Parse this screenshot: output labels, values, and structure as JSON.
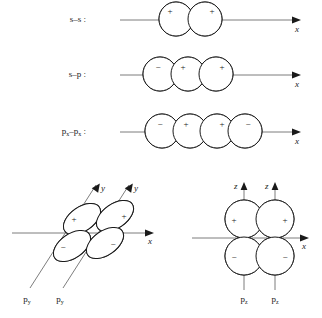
{
  "figure": {
    "background_color": "#ffffff",
    "line_color": "#1a1a1a",
    "axis_color": "#6e6e6e",
    "overlap_fill": "#c9c9c9",
    "lobe_fill": "#ffffff"
  },
  "rows": [
    {
      "id": "s-s",
      "label": "s–s :",
      "axis_label": "x",
      "orbital_count": 2,
      "signs": [
        "+",
        "+"
      ],
      "overlap_regions": 1,
      "shape": "circle"
    },
    {
      "id": "s-p",
      "label": "s–p :",
      "axis_label": "x",
      "orbital_count": 3,
      "signs": [
        "−",
        "+",
        "+"
      ],
      "overlap_regions": 1,
      "shape": "circle"
    },
    {
      "id": "px-px",
      "label_base": "p",
      "label_sub": "x",
      "label_mid": "–p",
      "label_sub2": "x",
      "label_end": " :",
      "axis_label": "x",
      "orbital_count": 4,
      "signs": [
        "−",
        "+",
        "+",
        "−"
      ],
      "overlap_regions": 1,
      "shape": "circle"
    }
  ],
  "bottom_left": {
    "id": "py-py",
    "axis_label_x": "x",
    "axis_label_y1": "y",
    "axis_label_y2": "y",
    "orbital_label_1_base": "p",
    "orbital_label_1_sub": "y",
    "orbital_label_2_base": "p",
    "orbital_label_2_sub": "y",
    "signs_top": [
      "+",
      "+"
    ],
    "signs_bottom": [
      "−",
      "−"
    ],
    "lobe_shape": "ellipse",
    "lobe_tilt_degrees": -35,
    "overlap_regions": 2
  },
  "bottom_right": {
    "id": "pz-pz",
    "axis_label_x": "x",
    "axis_label_z1": "z",
    "axis_label_z2": "z",
    "orbital_label_1_base": "p",
    "orbital_label_1_sub": "z",
    "orbital_label_2_base": "p",
    "orbital_label_2_sub": "z",
    "signs_top": [
      "+",
      "+"
    ],
    "signs_bottom": [
      "−",
      "−"
    ],
    "lobe_shape": "circle",
    "overlap_regions": 2
  }
}
